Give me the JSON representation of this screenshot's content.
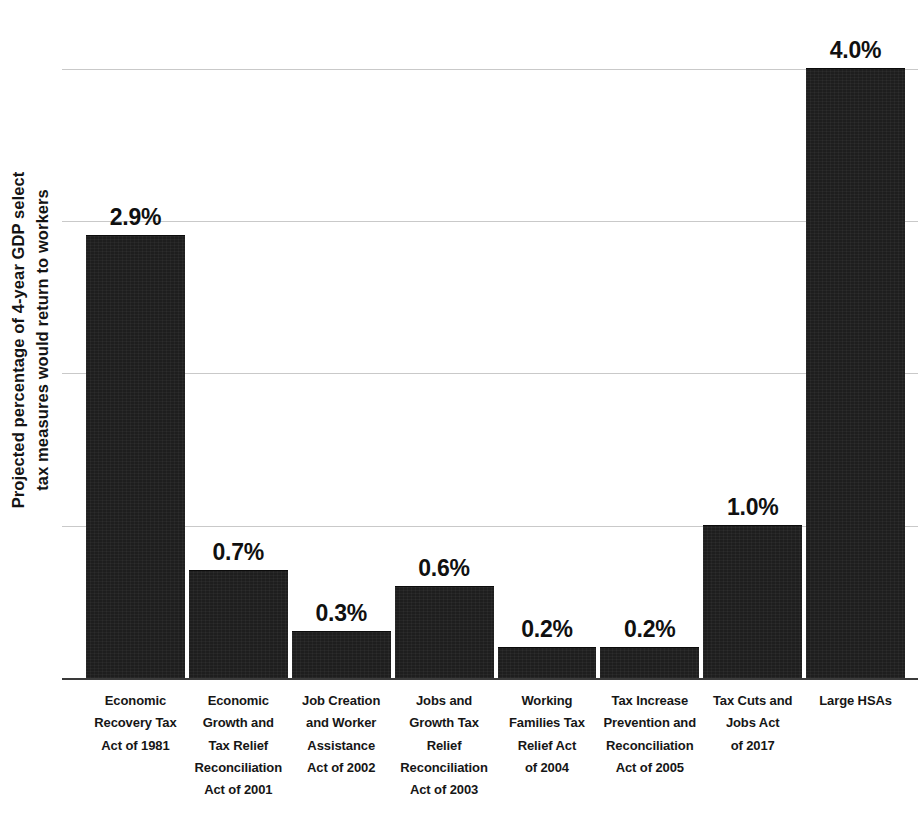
{
  "chart_data": {
    "type": "bar",
    "title": "",
    "subtitle": "",
    "xlabel": "",
    "ylabel": "Projected percentage of 4-year GDP select tax measures would return to workers",
    "ylabel_line1": "Projected percentage of 4-year GDP select",
    "ylabel_line2": "tax measures would return to workers",
    "ylim": [
      0,
      4.4
    ],
    "grid": true,
    "gridlines": [
      1,
      2,
      3,
      4
    ],
    "legend": "none",
    "bar_color": "#1e1e1e",
    "value_label_suffix": "%",
    "categories": [
      "Economic Recovery Tax Act of 1981",
      "Economic Growth and Tax Relief Reconciliation Act of 2001",
      "Job Creation and Worker Assistance Act of 2002",
      "Jobs and Growth Tax Relief Reconciliation Act of 2003",
      "Working Families Tax Relief Act of 2004",
      "Tax Increase Prevention and Reconciliation Act of 2005",
      "Tax Cuts and Jobs Act of 2017",
      "Large HSAs"
    ],
    "category_lines": [
      [
        "Economic",
        "Recovery Tax",
        "Act of 1981"
      ],
      [
        "Economic",
        "Growth and",
        "Tax Relief",
        "Reconciliation",
        "Act of 2001"
      ],
      [
        "Job Creation",
        "and Worker",
        "Assistance",
        "Act of 2002"
      ],
      [
        "Jobs and",
        "Growth Tax",
        "Relief",
        "Reconciliation",
        "Act of 2003"
      ],
      [
        "Working",
        "Families Tax",
        "Relief Act",
        "of 2004"
      ],
      [
        "Tax Increase",
        "Prevention and",
        "Reconciliation",
        "Act of 2005"
      ],
      [
        "Tax Cuts and",
        "Jobs Act",
        "of 2017"
      ],
      [
        "Large HSAs"
      ]
    ],
    "values": [
      2.9,
      0.7,
      0.3,
      0.6,
      0.2,
      0.2,
      1.0,
      4.0
    ],
    "value_labels": [
      "2.9%",
      "0.7%",
      "0.3%",
      "0.6%",
      "0.2%",
      "0.2%",
      "1.0%",
      "4.0%"
    ]
  }
}
